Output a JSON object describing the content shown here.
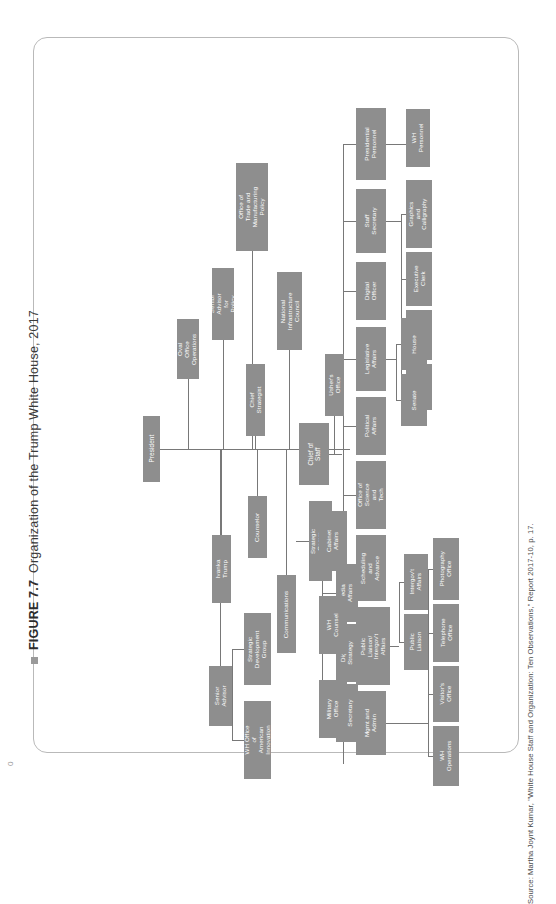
{
  "figure": {
    "bullet": "■",
    "number": "FIGURE 7.7",
    "title": "Organization of the Trump White House, 2017"
  },
  "source": "Source: Martha Joynt Kumar, \"White House Staff and Organization: Ten Observations,\" Report 2017-10, p. 17.",
  "folio": "0",
  "chart_data": {
    "type": "diagram",
    "title": "Organization of the Trump White House, 2017",
    "orientation": "rotated-90",
    "node_fill": "#8e8e8e",
    "node_text_color": "#ffffff",
    "link_color": "#787878",
    "root": "President",
    "nodes": [
      {
        "id": "president",
        "label": "President",
        "x": 62,
        "y": 330,
        "w": 17,
        "h": 66,
        "fs": 6.4
      },
      {
        "id": "oval_office",
        "label": "Oval Office\nOperations",
        "x": 96,
        "y": 233,
        "w": 22,
        "h": 60,
        "fs": 6.2
      },
      {
        "id": "senior_advisor_p",
        "label": "Senior Advisor\nfor Policy",
        "x": 131,
        "y": 182,
        "w": 22,
        "h": 72,
        "fs": 6.2
      },
      {
        "id": "chief_strategist",
        "label": "Chief Strategist",
        "x": 165,
        "y": 278,
        "w": 19,
        "h": 72,
        "fs": 6.2
      },
      {
        "id": "trade_mfg",
        "label": "Office of\nTrade and\nManufacturing\nPolicy",
        "x": 155,
        "y": 77,
        "w": 32,
        "h": 88,
        "fs": 6.2
      },
      {
        "id": "natl_infra",
        "label": "National\nInfrastructure\nCouncil",
        "x": 196,
        "y": 186,
        "w": 25,
        "h": 78,
        "fs": 6.2
      },
      {
        "id": "ivanka",
        "label": "Ivanka Trump",
        "x": 131,
        "y": 449,
        "w": 19,
        "h": 68,
        "fs": 6.2
      },
      {
        "id": "counselor",
        "label": "Counselor",
        "x": 167,
        "y": 410,
        "w": 19,
        "h": 62,
        "fs": 6.2
      },
      {
        "id": "senior_advisor",
        "label": "Senior\nAdvisor",
        "x": 128,
        "y": 580,
        "w": 23,
        "h": 60,
        "fs": 6.2
      },
      {
        "id": "strat_dev_group",
        "label": "Strategic\nDevelopment\nGroup",
        "x": 163,
        "y": 527,
        "w": 27,
        "h": 72,
        "fs": 6.2
      },
      {
        "id": "wh_innovation",
        "label": "WH Office\nof American\nInnovation",
        "x": 163,
        "y": 615,
        "w": 27,
        "h": 78,
        "fs": 6.2
      },
      {
        "id": "communications",
        "label": "Communications",
        "x": 196,
        "y": 489,
        "w": 19,
        "h": 78,
        "fs": 6.2
      },
      {
        "id": "strat_comm_dir",
        "label": "Strategic Comm\nDirector",
        "x": 228,
        "y": 415,
        "w": 23,
        "h": 80,
        "fs": 6.2
      },
      {
        "id": "media_affairs",
        "label": "Media\nAffairs",
        "x": 255,
        "y": 478,
        "w": 22,
        "h": 58,
        "fs": 6.2
      },
      {
        "id": "digital_strategy",
        "label": "Digital\nStrategy",
        "x": 255,
        "y": 538,
        "w": 22,
        "h": 58,
        "fs": 6.2
      },
      {
        "id": "press_secretary",
        "label": "Press\nSecretary",
        "x": 255,
        "y": 598,
        "w": 22,
        "h": 58,
        "fs": 6.2
      },
      {
        "id": "chief_of_staff",
        "label": "Chief of\nStaff",
        "x": 218,
        "y": 337,
        "w": 30,
        "h": 62,
        "fs": 6.4
      },
      {
        "id": "ushers_office",
        "label": "Usher's Office",
        "x": 244,
        "y": 268,
        "w": 19,
        "h": 62,
        "fs": 6.2
      },
      {
        "id": "presidential_personnel",
        "label": "Presidential\nPersonnel",
        "x": 275,
        "y": 22,
        "w": 30,
        "h": 72,
        "fs": 6.2
      },
      {
        "id": "wh_personnel",
        "label": "WH\nPersonnel",
        "x": 325,
        "y": 23,
        "w": 24,
        "h": 58,
        "fs": 6.2
      },
      {
        "id": "staff_secretary",
        "label": "Staff\nSecretary",
        "x": 275,
        "y": 103,
        "w": 30,
        "h": 64,
        "fs": 6.2
      },
      {
        "id": "graphics_callig",
        "label": "Graphics and\nCalligraphy",
        "x": 325,
        "y": 94,
        "w": 26,
        "h": 68,
        "fs": 6.0
      },
      {
        "id": "executive_clerk",
        "label": "Executive\nClerk",
        "x": 325,
        "y": 166,
        "w": 26,
        "h": 54,
        "fs": 6.0
      },
      {
        "id": "records_mgmt",
        "label": "Records\nMgmt",
        "x": 325,
        "y": 224,
        "w": 26,
        "h": 50,
        "fs": 6.0
      },
      {
        "id": "usps",
        "label": "USPS",
        "x": 325,
        "y": 278,
        "w": 26,
        "h": 46,
        "fs": 6.0
      },
      {
        "id": "digital_officer",
        "label": "Digital\nOfficer",
        "x": 275,
        "y": 176,
        "w": 30,
        "h": 58,
        "fs": 6.2
      },
      {
        "id": "legislative",
        "label": "Legislative\nAffairs",
        "x": 275,
        "y": 241,
        "w": 30,
        "h": 64,
        "fs": 6.2
      },
      {
        "id": "house",
        "label": "House",
        "x": 320,
        "y": 232,
        "w": 26,
        "h": 52,
        "fs": 6.2
      },
      {
        "id": "senate",
        "label": "Senate",
        "x": 320,
        "y": 288,
        "w": 26,
        "h": 52,
        "fs": 6.2
      },
      {
        "id": "political_affairs",
        "label": "Political\nAffairs",
        "x": 275,
        "y": 311,
        "w": 30,
        "h": 58,
        "fs": 6.2
      },
      {
        "id": "science_tech",
        "label": "Office of\nScience and\nTech",
        "x": 275,
        "y": 375,
        "w": 30,
        "h": 68,
        "fs": 6.2
      },
      {
        "id": "scheduling",
        "label": "Scheduling\nand\nAdvance",
        "x": 275,
        "y": 449,
        "w": 30,
        "h": 66,
        "fs": 6.2
      },
      {
        "id": "public_liaison_ig",
        "label": "Public\nLiaison/\nIntergov't\nAffairs",
        "x": 275,
        "y": 521,
        "w": 34,
        "h": 78,
        "fs": 6.0
      },
      {
        "id": "intergov_affairs",
        "label": "Intergov't\nAffairs",
        "x": 323,
        "y": 468,
        "w": 24,
        "h": 56,
        "fs": 6.0
      },
      {
        "id": "public_liaison",
        "label": "Public\nLiaison",
        "x": 323,
        "y": 528,
        "w": 24,
        "h": 56,
        "fs": 6.0
      },
      {
        "id": "mgmt_admin",
        "label": "Mgmt and\nAdmin",
        "x": 275,
        "y": 605,
        "w": 30,
        "h": 64,
        "fs": 6.2
      },
      {
        "id": "photography",
        "label": "Photography\nOffice",
        "x": 352,
        "y": 452,
        "w": 26,
        "h": 62,
        "fs": 6.0
      },
      {
        "id": "telephone",
        "label": "Telephone\nOffice",
        "x": 352,
        "y": 518,
        "w": 26,
        "h": 58,
        "fs": 6.0
      },
      {
        "id": "visitors",
        "label": "Visitor's\nOffice",
        "x": 352,
        "y": 580,
        "w": 26,
        "h": 56,
        "fs": 6.0
      },
      {
        "id": "wh_operations",
        "label": "WH\nOperations",
        "x": 352,
        "y": 640,
        "w": 26,
        "h": 60,
        "fs": 6.0
      },
      {
        "id": "military_office",
        "label": "Military\nOffice",
        "x": 238,
        "y": 594,
        "w": 28,
        "h": 58,
        "fs": 6.2
      },
      {
        "id": "wh_counsel",
        "label": "WH\nCounsel",
        "x": 238,
        "y": 510,
        "w": 28,
        "h": 58,
        "fs": 6.2
      },
      {
        "id": "cabinet_affairs",
        "label": "Cabinet\nAffairs",
        "x": 238,
        "y": 425,
        "w": 28,
        "h": 60,
        "fs": 6.2
      }
    ],
    "edges": [
      [
        "president",
        "oval_office"
      ],
      [
        "president",
        "senior_advisor_p"
      ],
      [
        "president",
        "chief_strategist"
      ],
      [
        "president",
        "trade_mfg"
      ],
      [
        "president",
        "natl_infra"
      ],
      [
        "president",
        "ivanka"
      ],
      [
        "president",
        "counselor"
      ],
      [
        "president",
        "senior_advisor"
      ],
      [
        "president",
        "communications"
      ],
      [
        "president",
        "chief_of_staff"
      ],
      [
        "senior_advisor",
        "strat_dev_group"
      ],
      [
        "senior_advisor",
        "wh_innovation"
      ],
      [
        "communications",
        "strat_comm_dir"
      ],
      [
        "communications",
        "media_affairs"
      ],
      [
        "communications",
        "digital_strategy"
      ],
      [
        "communications",
        "press_secretary"
      ],
      [
        "chief_of_staff",
        "ushers_office"
      ],
      [
        "chief_of_staff",
        "presidential_personnel"
      ],
      [
        "chief_of_staff",
        "staff_secretary"
      ],
      [
        "chief_of_staff",
        "digital_officer"
      ],
      [
        "chief_of_staff",
        "legislative"
      ],
      [
        "chief_of_staff",
        "political_affairs"
      ],
      [
        "chief_of_staff",
        "science_tech"
      ],
      [
        "chief_of_staff",
        "scheduling"
      ],
      [
        "chief_of_staff",
        "public_liaison_ig"
      ],
      [
        "chief_of_staff",
        "mgmt_admin"
      ],
      [
        "chief_of_staff",
        "military_office"
      ],
      [
        "chief_of_staff",
        "wh_counsel"
      ],
      [
        "chief_of_staff",
        "cabinet_affairs"
      ],
      [
        "presidential_personnel",
        "wh_personnel"
      ],
      [
        "staff_secretary",
        "graphics_callig"
      ],
      [
        "staff_secretary",
        "executive_clerk"
      ],
      [
        "staff_secretary",
        "records_mgmt"
      ],
      [
        "staff_secretary",
        "usps"
      ],
      [
        "legislative",
        "house"
      ],
      [
        "legislative",
        "senate"
      ],
      [
        "public_liaison_ig",
        "intergov_affairs"
      ],
      [
        "public_liaison_ig",
        "public_liaison"
      ],
      [
        "mgmt_admin",
        "photography"
      ],
      [
        "mgmt_admin",
        "telephone"
      ],
      [
        "mgmt_admin",
        "visitors"
      ],
      [
        "mgmt_admin",
        "wh_operations"
      ]
    ],
    "links": [
      {
        "t": "h",
        "x": 79,
        "y": 363,
        "l": 190
      },
      {
        "t": "v",
        "x": 107,
        "y": 293,
        "l": 70
      },
      {
        "t": "v",
        "x": 142,
        "y": 254,
        "l": 109
      },
      {
        "t": "v",
        "x": 174,
        "y": 350,
        "l": 13
      },
      {
        "t": "v",
        "x": 171,
        "y": 165,
        "l": 198
      },
      {
        "t": "v",
        "x": 208,
        "y": 264,
        "l": 99
      },
      {
        "t": "v",
        "x": 140,
        "y": 363,
        "l": 86
      },
      {
        "t": "v",
        "x": 176,
        "y": 363,
        "l": 47
      },
      {
        "t": "v",
        "x": 139,
        "y": 363,
        "l": 217
      },
      {
        "t": "v",
        "x": 205,
        "y": 363,
        "l": 126
      },
      {
        "t": "v",
        "x": 139,
        "y": 575,
        "l": 5
      },
      {
        "t": "h",
        "x": 151,
        "y": 563,
        "l": 12
      },
      {
        "t": "h",
        "x": 151,
        "y": 654,
        "l": 12
      },
      {
        "t": "v",
        "x": 151,
        "y": 563,
        "l": 91
      },
      {
        "t": "h",
        "x": 151,
        "y": 610,
        "l": 0
      },
      {
        "t": "h",
        "x": 215,
        "y": 455,
        "l": 13
      },
      {
        "t": "v",
        "x": 241,
        "y": 455,
        "l": 173
      },
      {
        "t": "h",
        "x": 241,
        "y": 507,
        "l": 14
      },
      {
        "t": "h",
        "x": 241,
        "y": 567,
        "l": 14
      },
      {
        "t": "h",
        "x": 241,
        "y": 627,
        "l": 14
      },
      {
        "t": "h",
        "x": 241,
        "y": 455,
        "l": 0
      },
      {
        "t": "v",
        "x": 253,
        "y": 330,
        "l": 38
      },
      {
        "t": "h",
        "x": 248,
        "y": 368,
        "l": 13
      },
      {
        "t": "v",
        "x": 262,
        "y": 58,
        "l": 620
      },
      {
        "t": "h",
        "x": 262,
        "y": 58,
        "l": 13
      },
      {
        "t": "h",
        "x": 262,
        "y": 135,
        "l": 13
      },
      {
        "t": "h",
        "x": 262,
        "y": 205,
        "l": 13
      },
      {
        "t": "h",
        "x": 262,
        "y": 273,
        "l": 13
      },
      {
        "t": "h",
        "x": 262,
        "y": 340,
        "l": 13
      },
      {
        "t": "h",
        "x": 262,
        "y": 409,
        "l": 13
      },
      {
        "t": "h",
        "x": 262,
        "y": 482,
        "l": 13
      },
      {
        "t": "h",
        "x": 262,
        "y": 560,
        "l": 13
      },
      {
        "t": "h",
        "x": 262,
        "y": 637,
        "l": 13
      },
      {
        "t": "h",
        "x": 262,
        "y": 623,
        "l": 0
      },
      {
        "t": "h",
        "x": 248,
        "y": 455,
        "l": 0
      },
      {
        "t": "h",
        "x": 305,
        "y": 58,
        "l": 20
      },
      {
        "t": "h",
        "x": 305,
        "y": 135,
        "l": 15
      },
      {
        "t": "v",
        "x": 320,
        "y": 128,
        "l": 188
      },
      {
        "t": "h",
        "x": 320,
        "y": 128,
        "l": 5
      },
      {
        "t": "h",
        "x": 320,
        "y": 193,
        "l": 5
      },
      {
        "t": "h",
        "x": 320,
        "y": 249,
        "l": 5
      },
      {
        "t": "h",
        "x": 320,
        "y": 301,
        "l": 5
      },
      {
        "t": "h",
        "x": 305,
        "y": 273,
        "l": 10
      },
      {
        "t": "v",
        "x": 315,
        "y": 258,
        "l": 56
      },
      {
        "t": "h",
        "x": 315,
        "y": 258,
        "l": 5
      },
      {
        "t": "h",
        "x": 315,
        "y": 314,
        "l": 5
      },
      {
        "t": "h",
        "x": 309,
        "y": 560,
        "l": 9
      },
      {
        "t": "v",
        "x": 318,
        "y": 496,
        "l": 60
      },
      {
        "t": "h",
        "x": 318,
        "y": 496,
        "l": 5
      },
      {
        "t": "h",
        "x": 318,
        "y": 556,
        "l": 5
      },
      {
        "t": "h",
        "x": 305,
        "y": 637,
        "l": 42
      },
      {
        "t": "v",
        "x": 347,
        "y": 483,
        "l": 187
      },
      {
        "t": "h",
        "x": 347,
        "y": 483,
        "l": 5
      },
      {
        "t": "h",
        "x": 347,
        "y": 547,
        "l": 5
      },
      {
        "t": "h",
        "x": 347,
        "y": 608,
        "l": 5
      },
      {
        "t": "h",
        "x": 347,
        "y": 670,
        "l": 5
      }
    ]
  }
}
